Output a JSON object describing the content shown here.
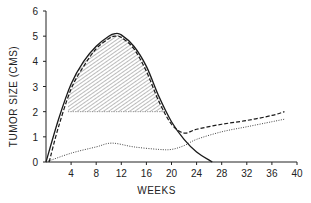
{
  "chart_data": {
    "type": "line",
    "title": "",
    "xlabel": "WEEKS",
    "ylabel": "TUMOR SIZE (CMS)",
    "xlim": [
      0,
      40
    ],
    "ylim": [
      0,
      6
    ],
    "x_ticks": [
      4,
      8,
      12,
      16,
      20,
      24,
      28,
      32,
      36,
      40
    ],
    "x_tick_labels": [
      "4",
      "8",
      "12",
      "16",
      "20",
      "24",
      "28",
      "32",
      "36",
      "40"
    ],
    "y_ticks": [
      0,
      1,
      2,
      3,
      4,
      5,
      6
    ],
    "y_tick_labels": [
      "0",
      "1",
      "2",
      "3",
      "4",
      "5",
      "6"
    ],
    "grid": false,
    "legend": null,
    "series": [
      {
        "name": "solid",
        "style": "solid",
        "x": [
          0,
          2,
          4,
          6,
          8,
          10,
          11,
          12,
          14,
          16,
          18,
          20,
          22,
          24,
          26.5
        ],
        "y": [
          0,
          1.7,
          3.1,
          4.0,
          4.6,
          5.0,
          5.1,
          5.05,
          4.6,
          3.8,
          2.6,
          1.6,
          0.9,
          0.4,
          0
        ]
      },
      {
        "name": "dashed",
        "style": "dashed",
        "x": [
          0.5,
          2,
          4,
          6,
          8,
          10,
          11,
          12,
          14,
          16,
          18,
          20,
          22,
          24,
          28,
          32,
          36,
          38
        ],
        "y": [
          0,
          1.4,
          2.9,
          3.8,
          4.5,
          4.9,
          5.0,
          4.95,
          4.5,
          3.6,
          2.4,
          1.5,
          1.15,
          1.3,
          1.5,
          1.65,
          1.85,
          2.0
        ]
      },
      {
        "name": "dotted",
        "style": "dotted",
        "x": [
          0,
          4,
          8,
          10.5,
          14,
          18,
          20,
          22,
          24,
          28,
          32,
          36,
          38
        ],
        "y": [
          0,
          0.35,
          0.6,
          0.75,
          0.6,
          0.5,
          0.5,
          0.65,
          0.9,
          1.2,
          1.4,
          1.6,
          1.7
        ]
      }
    ],
    "annotations": [
      {
        "type": "hatched_region",
        "description": "Hatched area under solid/dashed curves above tumor size 2 cm",
        "y_floor": 2,
        "x_range": [
          3.5,
          19
        ]
      }
    ]
  }
}
